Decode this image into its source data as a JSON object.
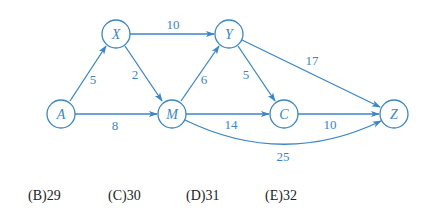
{
  "diagram": {
    "type": "weighted directed graph",
    "color": "#3a86c8",
    "nodes": [
      {
        "id": "A",
        "label": "A",
        "x": 61,
        "y": 114
      },
      {
        "id": "X",
        "label": "X",
        "x": 116,
        "y": 34
      },
      {
        "id": "M",
        "label": "M",
        "x": 172,
        "y": 114
      },
      {
        "id": "Y",
        "label": "Y",
        "x": 229,
        "y": 34
      },
      {
        "id": "C",
        "label": "C",
        "x": 284,
        "y": 114
      },
      {
        "id": "Z",
        "label": "Z",
        "x": 394,
        "y": 114
      }
    ],
    "edges": [
      {
        "from": "A",
        "to": "X",
        "weight": "5"
      },
      {
        "from": "A",
        "to": "M",
        "weight": "8"
      },
      {
        "from": "X",
        "to": "Y",
        "weight": "10"
      },
      {
        "from": "X",
        "to": "M",
        "weight": "2"
      },
      {
        "from": "M",
        "to": "Y",
        "weight": "6"
      },
      {
        "from": "Y",
        "to": "C",
        "weight": "5"
      },
      {
        "from": "Y",
        "to": "Z",
        "weight": "17"
      },
      {
        "from": "M",
        "to": "C",
        "weight": "14"
      },
      {
        "from": "C",
        "to": "Z",
        "weight": "10"
      },
      {
        "from": "M",
        "to": "Z",
        "weight": "25",
        "curved": true
      }
    ]
  },
  "options": [
    {
      "letter": "(B)",
      "value": "29"
    },
    {
      "letter": "(C)",
      "value": "30"
    },
    {
      "letter": "(D)",
      "value": "31"
    },
    {
      "letter": "(E)",
      "value": "32"
    }
  ]
}
